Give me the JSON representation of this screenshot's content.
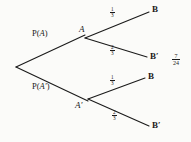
{
  "diagram": {
    "type": "probability-tree",
    "root": {
      "name": "root-node",
      "x": 16,
      "y": 67
    },
    "stage1": {
      "branches": [
        {
          "id": "branch-a",
          "label": "P(A)",
          "label_text_prefix": "P(",
          "label_variable": "A",
          "label_text_suffix": ")",
          "node_label": "A",
          "node_x": 85,
          "node_y": 35
        },
        {
          "id": "branch-a-prime",
          "label": "P(A′)",
          "label_text_prefix": "P(",
          "label_variable": "A′",
          "label_text_suffix": ")",
          "node_label": "A′",
          "node_x": 88,
          "node_y": 101
        }
      ]
    },
    "stage2": {
      "branches": [
        {
          "id": "a-to-b",
          "from": "A",
          "leaf": "B",
          "probability": "1/3",
          "numerator": "1",
          "denominator": "3",
          "leaf_x": 152,
          "leaf_y": 10
        },
        {
          "id": "a-to-b-prime",
          "from": "A",
          "leaf": "B′",
          "probability": "2/3",
          "numerator": "2",
          "denominator": "3",
          "leaf_x": 150,
          "leaf_y": 57
        },
        {
          "id": "aprime-to-b",
          "from": "A′",
          "leaf": "B",
          "probability": "1/3",
          "numerator": "1",
          "denominator": "3",
          "leaf_x": 148,
          "leaf_y": 77
        },
        {
          "id": "aprime-to-b-prime",
          "from": "A′",
          "leaf": "B′",
          "probability": "2/3",
          "numerator": "2",
          "denominator": "3",
          "leaf_x": 152,
          "leaf_y": 126
        }
      ]
    },
    "annotation": {
      "id": "result-fraction",
      "value": "7/24",
      "numerator": "7",
      "denominator": "24",
      "x": 172,
      "y": 58
    },
    "colors": {
      "line": "#1a1a1a",
      "text": "#1a1a1a",
      "background": "#fbfbf9"
    }
  }
}
